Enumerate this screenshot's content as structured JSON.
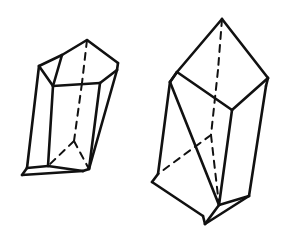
{
  "figure": {
    "background_color": "#ffffff",
    "ink_color": "#111111",
    "canvas": {
      "width": 283,
      "height": 241
    },
    "style": {
      "solid_edge_width": 2.6,
      "hidden_edge_width": 2.0,
      "hidden_dash_pattern": "7 6"
    },
    "shapes": [
      {
        "id": "left-crystal",
        "name": "Left prismatic crystal",
        "description": "Slender quadrilateral prism tilted to the left with a pointed roof-shaped termination at the top; a narrow sliver face visible along the left side; bottom face open toward the viewer with hidden back edges shown dashed.",
        "outline": [
          [
            87,
            40
          ],
          [
            118,
            63
          ],
          [
            117,
            70
          ],
          [
            89,
            169
          ],
          [
            83,
            171
          ],
          [
            22,
            175
          ],
          [
            27,
            168
          ],
          [
            33,
            113
          ],
          [
            39,
            66
          ],
          [
            62,
            55
          ]
        ],
        "visible_edges": [
          [
            [
              87,
              40
            ],
            [
              118,
              63
            ]
          ],
          [
            [
              118,
              63
            ],
            [
              117,
              70
            ]
          ],
          [
            [
              117,
              70
            ],
            [
              89,
              169
            ]
          ],
          [
            [
              89,
              169
            ],
            [
              83,
              171
            ]
          ],
          [
            [
              83,
              171
            ],
            [
              22,
              175
            ]
          ],
          [
            [
              22,
              175
            ],
            [
              27,
              168
            ]
          ],
          [
            [
              27,
              168
            ],
            [
              39,
              66
            ]
          ],
          [
            [
              39,
              66
            ],
            [
              62,
              55
            ]
          ],
          [
            [
              62,
              55
            ],
            [
              87,
              40
            ]
          ],
          [
            [
              39,
              66
            ],
            [
              53,
              86
            ]
          ],
          [
            [
              53,
              86
            ],
            [
              100,
              83
            ]
          ],
          [
            [
              100,
              83
            ],
            [
              117,
              70
            ]
          ],
          [
            [
              53,
              86
            ],
            [
              48,
              166
            ]
          ],
          [
            [
              48,
              166
            ],
            [
              83,
              171
            ]
          ],
          [
            [
              48,
              166
            ],
            [
              27,
              168
            ]
          ],
          [
            [
              62,
              55
            ],
            [
              53,
              86
            ]
          ],
          [
            [
              100,
              83
            ],
            [
              89,
              169
            ]
          ]
        ],
        "hidden_edges": [
          [
            [
              87,
              40
            ],
            [
              82,
              83
            ]
          ],
          [
            [
              82,
              83
            ],
            [
              74,
              141
            ]
          ],
          [
            [
              74,
              141
            ],
            [
              48,
              166
            ]
          ],
          [
            [
              74,
              141
            ],
            [
              89,
              169
            ]
          ]
        ]
      },
      {
        "id": "right-crystal",
        "name": "Right prismatic crystal",
        "description": "Larger upright rectangular prism tilted to the right with a pointed roof-shaped termination on top; the near bottom corner projects downward and hidden back edges form a Y junction shown dashed.",
        "outline": [
          [
            222,
            19
          ],
          [
            268,
            78
          ],
          [
            266,
            86
          ],
          [
            249,
            196
          ],
          [
            205,
            224
          ],
          [
            203,
            216
          ],
          [
            152,
            182
          ],
          [
            158,
            174
          ],
          [
            170,
            82
          ],
          [
            177,
            72
          ]
        ],
        "visible_edges": [
          [
            [
              222,
              19
            ],
            [
              268,
              78
            ]
          ],
          [
            [
              268,
              78
            ],
            [
              266,
              86
            ]
          ],
          [
            [
              266,
              86
            ],
            [
              249,
              196
            ]
          ],
          [
            [
              249,
              196
            ],
            [
              205,
              224
            ]
          ],
          [
            [
              205,
              224
            ],
            [
              203,
              216
            ]
          ],
          [
            [
              203,
              216
            ],
            [
              152,
              182
            ]
          ],
          [
            [
              152,
              182
            ],
            [
              158,
              174
            ]
          ],
          [
            [
              158,
              174
            ],
            [
              170,
              82
            ]
          ],
          [
            [
              170,
              82
            ],
            [
              177,
              72
            ]
          ],
          [
            [
              177,
              72
            ],
            [
              222,
              19
            ]
          ],
          [
            [
              177,
              72
            ],
            [
              232,
              110
            ]
          ],
          [
            [
              232,
              110
            ],
            [
              268,
              78
            ]
          ],
          [
            [
              232,
              110
            ],
            [
              219,
              205
            ]
          ],
          [
            [
              219,
              205
            ],
            [
              249,
              196
            ]
          ],
          [
            [
              219,
              205
            ],
            [
              205,
              224
            ]
          ],
          [
            [
              170,
              82
            ],
            [
              219,
              205
            ]
          ],
          [
            [
              177,
              72
            ],
            [
              170,
              82
            ]
          ]
        ],
        "hidden_edges": [
          [
            [
              222,
              19
            ],
            [
              218,
              70
            ]
          ],
          [
            [
              218,
              70
            ],
            [
              211,
              135
            ]
          ],
          [
            [
              211,
              135
            ],
            [
              158,
              174
            ]
          ],
          [
            [
              211,
              135
            ],
            [
              219,
              205
            ]
          ]
        ]
      }
    ]
  }
}
